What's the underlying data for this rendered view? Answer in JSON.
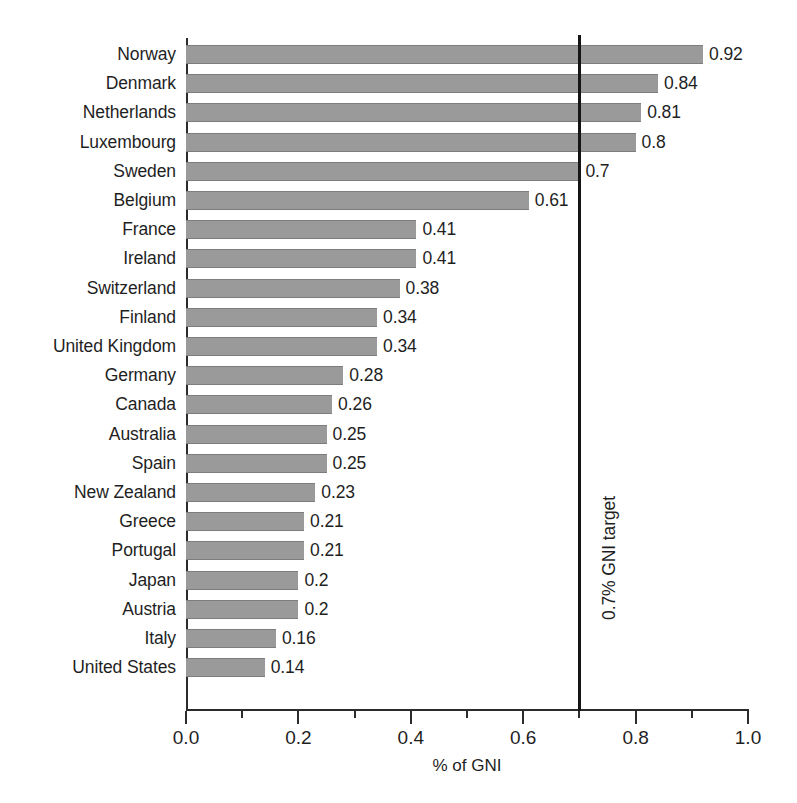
{
  "chart_data": {
    "type": "bar",
    "orientation": "horizontal",
    "title": "",
    "subtitle": "",
    "xlabel": "% of GNI",
    "ylabel": "",
    "xlim": [
      0.0,
      1.0
    ],
    "ylim": null,
    "grid": false,
    "legend": null,
    "x_ticks_major": [
      "0.0",
      "0.2",
      "0.4",
      "0.6",
      "0.8",
      "1.0"
    ],
    "x_tick_values_major": [
      0.0,
      0.2,
      0.4,
      0.6,
      0.8,
      1.0
    ],
    "x_tick_values_minor": [
      0.1,
      0.3,
      0.5,
      0.7,
      0.9
    ],
    "categories": [
      "Norway",
      "Denmark",
      "Netherlands",
      "Luxembourg",
      "Sweden",
      "Belgium",
      "France",
      "Ireland",
      "Switzerland",
      "Finland",
      "United Kingdom",
      "Germany",
      "Canada",
      "Australia",
      "Spain",
      "New Zealand",
      "Greece",
      "Portugal",
      "Japan",
      "Austria",
      "Italy",
      "United States"
    ],
    "values": [
      0.92,
      0.84,
      0.81,
      0.8,
      0.7,
      0.61,
      0.41,
      0.41,
      0.38,
      0.34,
      0.34,
      0.28,
      0.26,
      0.25,
      0.25,
      0.23,
      0.21,
      0.21,
      0.2,
      0.2,
      0.16,
      0.14
    ],
    "value_labels": [
      "0.92",
      "0.84",
      "0.81",
      "0.8",
      "0.7",
      "0.61",
      "0.41",
      "0.41",
      "0.38",
      "0.34",
      "0.34",
      "0.28",
      "0.26",
      "0.25",
      "0.25",
      "0.23",
      "0.21",
      "0.21",
      "0.2",
      "0.2",
      "0.16",
      "0.14"
    ],
    "bar_color": "#9a9a9a",
    "bar_edge_color": "#7d7d7d",
    "annotations": [
      {
        "name": "gni-target-line",
        "text": "0.7% GNI target",
        "value": 0.7,
        "orientation": "vertical",
        "color": "#151515"
      }
    ]
  }
}
